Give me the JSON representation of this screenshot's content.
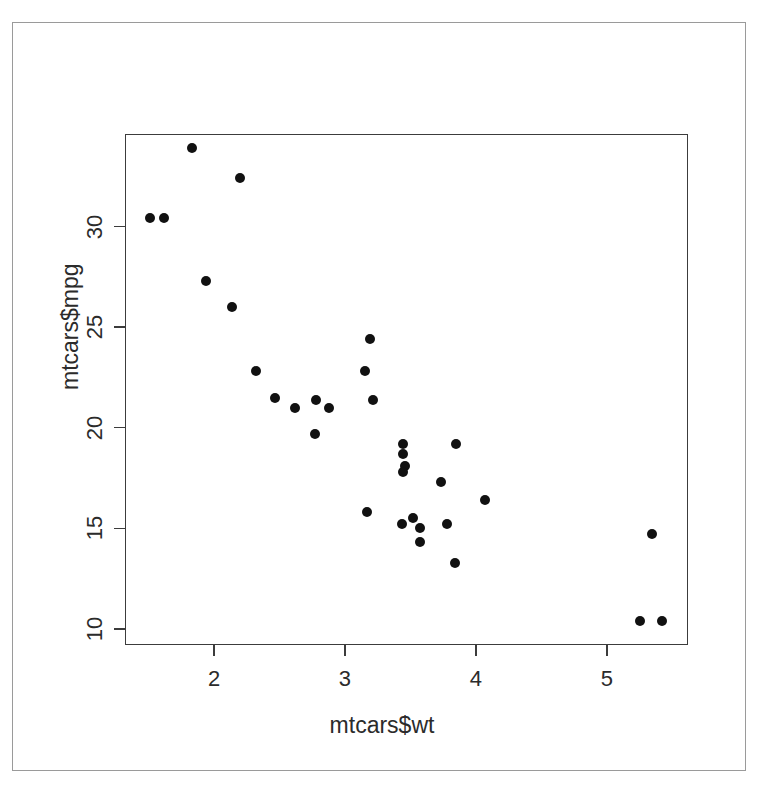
{
  "chart_data": {
    "type": "scatter",
    "title": "",
    "xlabel": "mtcars$wt",
    "ylabel": "mtcars$mpg",
    "xlim": [
      1.32,
      5.62
    ],
    "ylim": [
      9.2,
      34.6
    ],
    "xticks": [
      2,
      3,
      4,
      5
    ],
    "xticklabels": [
      "2",
      "3",
      "4",
      "5"
    ],
    "yticks": [
      10,
      15,
      20,
      25,
      30
    ],
    "yticklabels": [
      "10",
      "15",
      "20",
      "25",
      "30"
    ],
    "grid": false,
    "legend": null,
    "marker": "filled-circle",
    "marker_color": "#111111",
    "box": true,
    "tick_direction": "outward",
    "n_points": 32,
    "x": [
      2.62,
      2.875,
      2.32,
      3.215,
      3.44,
      3.46,
      3.57,
      3.19,
      3.15,
      3.44,
      3.44,
      4.07,
      3.73,
      3.78,
      5.25,
      5.424,
      5.345,
      2.2,
      1.615,
      1.835,
      2.465,
      3.52,
      3.435,
      3.84,
      3.845,
      1.935,
      2.14,
      1.513,
      3.17,
      2.77,
      3.57,
      2.78
    ],
    "y": [
      21.0,
      21.0,
      22.8,
      21.4,
      18.7,
      18.1,
      14.3,
      24.4,
      22.8,
      19.2,
      17.8,
      16.4,
      17.3,
      15.2,
      10.4,
      10.4,
      14.7,
      32.4,
      30.4,
      33.9,
      21.5,
      15.5,
      15.2,
      13.3,
      19.2,
      27.3,
      26.0,
      30.4,
      15.8,
      19.7,
      15.0,
      21.4
    ],
    "points": [
      {
        "x": 2.62,
        "y": 21.0
      },
      {
        "x": 2.875,
        "y": 21.0
      },
      {
        "x": 2.32,
        "y": 22.8
      },
      {
        "x": 3.215,
        "y": 21.4
      },
      {
        "x": 3.44,
        "y": 18.7
      },
      {
        "x": 3.46,
        "y": 18.1
      },
      {
        "x": 3.57,
        "y": 14.3
      },
      {
        "x": 3.19,
        "y": 24.4
      },
      {
        "x": 3.15,
        "y": 22.8
      },
      {
        "x": 3.44,
        "y": 19.2
      },
      {
        "x": 3.44,
        "y": 17.8
      },
      {
        "x": 4.07,
        "y": 16.4
      },
      {
        "x": 3.73,
        "y": 17.3
      },
      {
        "x": 3.78,
        "y": 15.2
      },
      {
        "x": 5.25,
        "y": 10.4
      },
      {
        "x": 5.424,
        "y": 10.4
      },
      {
        "x": 5.345,
        "y": 14.7
      },
      {
        "x": 2.2,
        "y": 32.4
      },
      {
        "x": 1.615,
        "y": 30.4
      },
      {
        "x": 1.835,
        "y": 33.9
      },
      {
        "x": 2.465,
        "y": 21.5
      },
      {
        "x": 3.52,
        "y": 15.5
      },
      {
        "x": 3.435,
        "y": 15.2
      },
      {
        "x": 3.84,
        "y": 13.3
      },
      {
        "x": 3.845,
        "y": 19.2
      },
      {
        "x": 1.935,
        "y": 27.3
      },
      {
        "x": 2.14,
        "y": 26.0
      },
      {
        "x": 1.513,
        "y": 30.4
      },
      {
        "x": 3.17,
        "y": 15.8
      },
      {
        "x": 2.77,
        "y": 19.7
      },
      {
        "x": 3.57,
        "y": 15.0
      },
      {
        "x": 2.78,
        "y": 21.4
      }
    ]
  }
}
